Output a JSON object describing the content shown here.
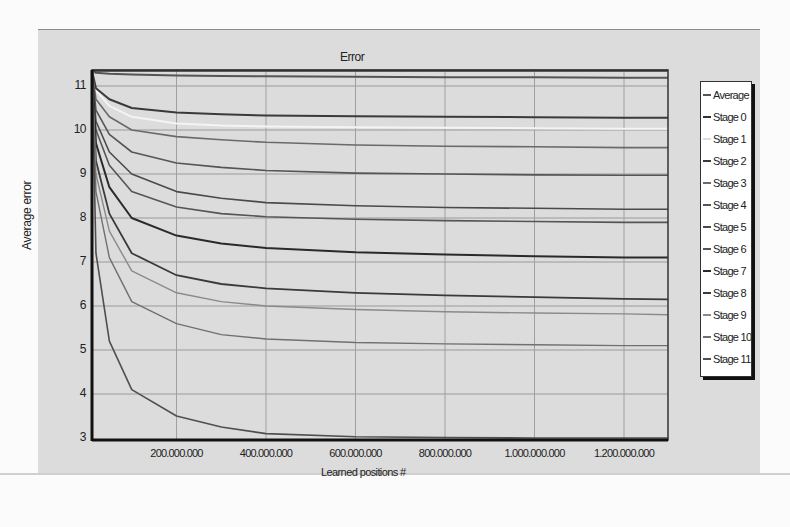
{
  "chart_data": {
    "type": "line",
    "title": "Error",
    "xlabel": "Learned positions #",
    "ylabel": "Average error",
    "xlim": [
      0,
      1300000000
    ],
    "ylim": [
      3,
      11.35
    ],
    "grid": true,
    "legend_position": "right",
    "x_tick_labels": [
      "200.000.000",
      "400.000.000",
      "600.000.000",
      "800.000.000",
      "1.000.000.000",
      "1.200.000.000"
    ],
    "x_ticks": [
      200000000,
      400000000,
      600000000,
      800000000,
      1000000000,
      1200000000
    ],
    "y_ticks": [
      3,
      4,
      5,
      6,
      7,
      8,
      9,
      10,
      11
    ],
    "x": [
      0,
      20000000,
      50000000,
      100000000,
      200000000,
      300000000,
      400000000,
      600000000,
      800000000,
      1000000000,
      1200000000,
      1300000000
    ],
    "series": [
      {
        "name": "Average",
        "color": "#555555",
        "width": 2,
        "values": [
          11.35,
          11.3,
          11.28,
          11.26,
          11.24,
          11.23,
          11.22,
          11.21,
          11.2,
          11.2,
          11.19,
          11.19
        ]
      },
      {
        "name": "Stage 0",
        "color": "#333333",
        "width": 2.2,
        "values": [
          11.35,
          11.35,
          11.35,
          11.35,
          11.35,
          11.35,
          11.35,
          11.35,
          11.35,
          11.35,
          11.35,
          11.35
        ]
      },
      {
        "name": "Stage 1",
        "color": "#f4f4f4",
        "width": 2,
        "values": [
          11.35,
          10.9,
          10.55,
          10.3,
          10.15,
          10.1,
          10.08,
          10.06,
          10.05,
          10.04,
          10.03,
          10.03
        ]
      },
      {
        "name": "Stage 2",
        "color": "#3a3a3a",
        "width": 2,
        "values": [
          11.35,
          10.95,
          10.7,
          10.5,
          10.4,
          10.36,
          10.33,
          10.31,
          10.3,
          10.29,
          10.28,
          10.28
        ]
      },
      {
        "name": "Stage 3",
        "color": "#6a6a6a",
        "width": 1.6,
        "values": [
          11.35,
          10.7,
          10.3,
          10.0,
          9.85,
          9.78,
          9.72,
          9.66,
          9.63,
          9.62,
          9.6,
          9.6
        ]
      },
      {
        "name": "Stage 4",
        "color": "#555555",
        "width": 1.6,
        "values": [
          11.35,
          10.45,
          9.9,
          9.5,
          9.25,
          9.15,
          9.08,
          9.02,
          9.0,
          8.98,
          8.97,
          8.97
        ]
      },
      {
        "name": "Stage 5",
        "color": "#4a4a4a",
        "width": 1.6,
        "values": [
          11.35,
          10.2,
          9.5,
          9.0,
          8.6,
          8.45,
          8.35,
          8.28,
          8.24,
          8.22,
          8.2,
          8.2
        ]
      },
      {
        "name": "Stage 6",
        "color": "#555555",
        "width": 1.6,
        "values": [
          11.35,
          10.0,
          9.2,
          8.6,
          8.25,
          8.1,
          8.03,
          7.97,
          7.94,
          7.92,
          7.9,
          7.9
        ]
      },
      {
        "name": "Stage 7",
        "color": "#2a2a2a",
        "width": 2,
        "values": [
          11.35,
          9.7,
          8.7,
          8.0,
          7.6,
          7.42,
          7.32,
          7.22,
          7.17,
          7.13,
          7.1,
          7.1
        ]
      },
      {
        "name": "Stage 8",
        "color": "#3a3a3a",
        "width": 1.8,
        "values": [
          11.35,
          9.3,
          8.1,
          7.2,
          6.7,
          6.5,
          6.4,
          6.3,
          6.24,
          6.2,
          6.16,
          6.15
        ]
      },
      {
        "name": "Stage 9",
        "color": "#8a8a8a",
        "width": 1.4,
        "values": [
          11.35,
          9.0,
          7.7,
          6.8,
          6.3,
          6.1,
          6.0,
          5.92,
          5.87,
          5.84,
          5.82,
          5.8
        ]
      },
      {
        "name": "Stage 10",
        "color": "#707070",
        "width": 1.4,
        "values": [
          11.35,
          8.6,
          7.1,
          6.1,
          5.6,
          5.35,
          5.25,
          5.17,
          5.14,
          5.12,
          5.1,
          5.1
        ]
      },
      {
        "name": "Stage 11",
        "color": "#4f4f4f",
        "width": 1.6,
        "values": [
          11.35,
          7.2,
          5.2,
          4.1,
          3.5,
          3.25,
          3.1,
          3.03,
          3.01,
          3.0,
          3.0,
          3.0
        ]
      }
    ],
    "extra_gridline_series_note": "additional faint lines near 10.0, 8.0, 7.0 and 4.95"
  },
  "legend": {
    "items": [
      "Average",
      "Stage 0",
      "Stage 1",
      "Stage 2",
      "Stage 3",
      "Stage 4",
      "Stage 5",
      "Stage 6",
      "Stage 7",
      "Stage 8",
      "Stage 9",
      "Stage 10",
      "Stage 11"
    ]
  }
}
